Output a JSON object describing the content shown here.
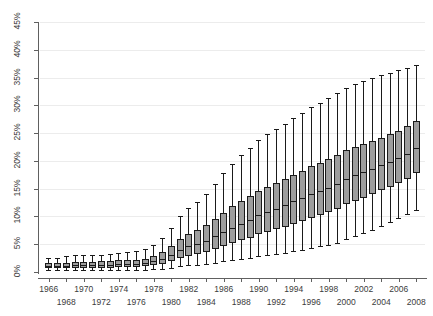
{
  "chart_data": {
    "type": "box",
    "title": "",
    "subtitle": "",
    "xlabel": "",
    "ylabel": "",
    "ylim": [
      0,
      45
    ],
    "ytick_values": [
      0,
      5,
      10,
      15,
      20,
      25,
      30,
      35,
      40,
      45
    ],
    "ytick_labels": [
      "0%",
      "5%",
      "10%",
      "15%",
      "20%",
      "25%",
      "30%",
      "35%",
      "40%",
      "45%"
    ],
    "grid": true,
    "legend": "none",
    "xtick_labels_upper": [
      "1966",
      "1970",
      "1974",
      "1978",
      "1982",
      "1986",
      "1990",
      "1994",
      "1998",
      "2002",
      "2006"
    ],
    "xtick_labels_lower": [
      "1968",
      "1972",
      "1976",
      "1980",
      "1984",
      "1988",
      "1992",
      "1996",
      "2000",
      "2004",
      "2008"
    ],
    "x_categories": [
      1966,
      1967,
      1968,
      1969,
      1970,
      1971,
      1972,
      1973,
      1974,
      1975,
      1976,
      1977,
      1978,
      1979,
      1980,
      1981,
      1982,
      1983,
      1984,
      1985,
      1986,
      1987,
      1988,
      1989,
      1990,
      1991,
      1992,
      1993,
      1994,
      1995,
      1996,
      1997,
      1998,
      1999,
      2000,
      2001,
      2002,
      2003,
      2004,
      2005,
      2006,
      2007,
      2008
    ],
    "boxes": [
      {
        "year": 1966,
        "whisker_low": 0.3,
        "q1": 0.7,
        "median": 1.1,
        "q3": 1.6,
        "whisker_high": 2.5
      },
      {
        "year": 1967,
        "whisker_low": 0.3,
        "q1": 0.7,
        "median": 1.1,
        "q3": 1.6,
        "whisker_high": 2.6
      },
      {
        "year": 1968,
        "whisker_low": 0.3,
        "q1": 0.7,
        "median": 1.1,
        "q3": 1.7,
        "whisker_high": 2.8
      },
      {
        "year": 1969,
        "whisker_low": 0.3,
        "q1": 0.8,
        "median": 1.2,
        "q3": 1.8,
        "whisker_high": 3.0
      },
      {
        "year": 1970,
        "whisker_low": 0.3,
        "q1": 0.8,
        "median": 1.2,
        "q3": 1.8,
        "whisker_high": 3.1
      },
      {
        "year": 1971,
        "whisker_low": 0.3,
        "q1": 0.8,
        "median": 1.2,
        "q3": 1.8,
        "whisker_high": 3.0
      },
      {
        "year": 1972,
        "whisker_low": 0.3,
        "q1": 0.8,
        "median": 1.2,
        "q3": 1.9,
        "whisker_high": 3.1
      },
      {
        "year": 1973,
        "whisker_low": 0.3,
        "q1": 0.8,
        "median": 1.3,
        "q3": 1.9,
        "whisker_high": 3.2
      },
      {
        "year": 1974,
        "whisker_low": 0.4,
        "q1": 0.9,
        "median": 1.4,
        "q3": 2.1,
        "whisker_high": 3.5
      },
      {
        "year": 1975,
        "whisker_low": 0.4,
        "q1": 0.9,
        "median": 1.4,
        "q3": 2.1,
        "whisker_high": 3.6
      },
      {
        "year": 1976,
        "whisker_low": 0.4,
        "q1": 0.9,
        "median": 1.4,
        "q3": 2.2,
        "whisker_high": 3.7
      },
      {
        "year": 1977,
        "whisker_low": 0.4,
        "q1": 1.0,
        "median": 1.6,
        "q3": 2.4,
        "whisker_high": 4.1
      },
      {
        "year": 1978,
        "whisker_low": 0.5,
        "q1": 1.2,
        "median": 1.9,
        "q3": 2.9,
        "whisker_high": 4.9
      },
      {
        "year": 1979,
        "whisker_low": 0.6,
        "q1": 1.5,
        "median": 2.4,
        "q3": 3.6,
        "whisker_high": 6.2
      },
      {
        "year": 1980,
        "whisker_low": 0.8,
        "q1": 2.0,
        "median": 3.1,
        "q3": 4.7,
        "whisker_high": 8.0
      },
      {
        "year": 1981,
        "whisker_low": 1.0,
        "q1": 2.5,
        "median": 3.9,
        "q3": 5.9,
        "whisker_high": 10.0
      },
      {
        "year": 1982,
        "whisker_low": 1.2,
        "q1": 2.9,
        "median": 4.6,
        "q3": 6.9,
        "whisker_high": 11.6
      },
      {
        "year": 1983,
        "whisker_low": 1.3,
        "q1": 3.2,
        "median": 5.0,
        "q3": 7.5,
        "whisker_high": 12.6
      },
      {
        "year": 1984,
        "whisker_low": 1.5,
        "q1": 3.6,
        "median": 5.6,
        "q3": 8.4,
        "whisker_high": 14.0
      },
      {
        "year": 1985,
        "whisker_low": 1.7,
        "q1": 4.1,
        "median": 6.4,
        "q3": 9.5,
        "whisker_high": 15.8
      },
      {
        "year": 1986,
        "whisker_low": 1.9,
        "q1": 4.7,
        "median": 7.2,
        "q3": 10.7,
        "whisker_high": 17.8
      },
      {
        "year": 1987,
        "whisker_low": 2.1,
        "q1": 5.2,
        "median": 8.0,
        "q3": 11.8,
        "whisker_high": 19.5
      },
      {
        "year": 1988,
        "whisker_low": 2.3,
        "q1": 5.7,
        "median": 8.7,
        "q3": 12.7,
        "whisker_high": 21.0
      },
      {
        "year": 1989,
        "whisker_low": 2.5,
        "q1": 6.2,
        "median": 9.4,
        "q3": 13.6,
        "whisker_high": 22.3
      },
      {
        "year": 1990,
        "whisker_low": 2.8,
        "q1": 6.8,
        "median": 10.2,
        "q3": 14.6,
        "whisker_high": 23.8
      },
      {
        "year": 1991,
        "whisker_low": 3.0,
        "q1": 7.2,
        "median": 10.8,
        "q3": 15.3,
        "whisker_high": 24.8
      },
      {
        "year": 1992,
        "whisker_low": 3.2,
        "q1": 7.7,
        "median": 11.4,
        "q3": 16.0,
        "whisker_high": 25.8
      },
      {
        "year": 1993,
        "whisker_low": 3.4,
        "q1": 8.1,
        "median": 12.0,
        "q3": 16.7,
        "whisker_high": 26.7
      },
      {
        "year": 1994,
        "whisker_low": 3.7,
        "q1": 8.7,
        "median": 12.7,
        "q3": 17.5,
        "whisker_high": 27.8
      },
      {
        "year": 1995,
        "whisker_low": 4.0,
        "q1": 9.2,
        "median": 13.3,
        "q3": 18.2,
        "whisker_high": 28.7
      },
      {
        "year": 1996,
        "whisker_low": 4.3,
        "q1": 9.8,
        "median": 14.0,
        "q3": 19.0,
        "whisker_high": 29.7
      },
      {
        "year": 1997,
        "whisker_low": 4.6,
        "q1": 10.3,
        "median": 14.6,
        "q3": 19.7,
        "whisker_high": 30.5
      },
      {
        "year": 1998,
        "whisker_low": 4.9,
        "q1": 10.8,
        "median": 15.2,
        "q3": 20.3,
        "whisker_high": 31.3
      },
      {
        "year": 1999,
        "whisker_low": 5.3,
        "q1": 11.4,
        "median": 15.9,
        "q3": 21.0,
        "whisker_high": 32.2
      },
      {
        "year": 2000,
        "whisker_low": 5.9,
        "q1": 12.2,
        "median": 16.8,
        "q3": 21.9,
        "whisker_high": 33.2
      },
      {
        "year": 2001,
        "whisker_low": 6.4,
        "q1": 12.8,
        "median": 17.4,
        "q3": 22.5,
        "whisker_high": 33.9
      },
      {
        "year": 2002,
        "whisker_low": 7.0,
        "q1": 13.4,
        "median": 18.0,
        "q3": 23.0,
        "whisker_high": 34.4
      },
      {
        "year": 2003,
        "whisker_low": 7.6,
        "q1": 14.0,
        "median": 18.6,
        "q3": 23.6,
        "whisker_high": 34.9
      },
      {
        "year": 2004,
        "whisker_low": 8.3,
        "q1": 14.7,
        "median": 19.2,
        "q3": 24.2,
        "whisker_high": 35.4
      },
      {
        "year": 2005,
        "whisker_low": 9.0,
        "q1": 15.3,
        "median": 19.8,
        "q3": 24.8,
        "whisker_high": 35.9
      },
      {
        "year": 2006,
        "whisker_low": 9.7,
        "q1": 16.0,
        "median": 20.5,
        "q3": 25.4,
        "whisker_high": 36.3
      },
      {
        "year": 2007,
        "whisker_low": 10.4,
        "q1": 16.8,
        "median": 21.3,
        "q3": 26.2,
        "whisker_high": 36.8
      },
      {
        "year": 2008,
        "whisker_low": 11.2,
        "q1": 17.8,
        "median": 22.4,
        "q3": 27.2,
        "whisker_high": 37.3
      }
    ]
  },
  "style": {
    "box_fill": "#9d9d9d",
    "box_stroke": "#1a1a1a",
    "grid_color": "#ececec",
    "axis_color": "#606060",
    "text_color": "#3b3b3b",
    "background": "#ffffff"
  }
}
